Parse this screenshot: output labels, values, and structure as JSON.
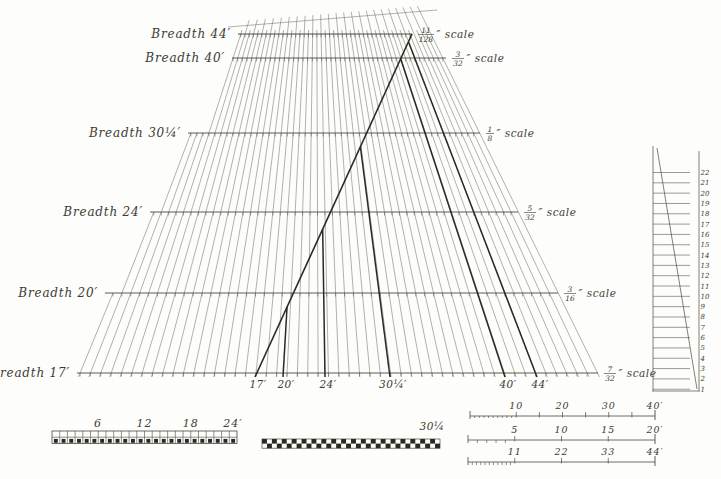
{
  "diagram": {
    "ink_color": "#3c3c33",
    "thin_line_color": "#72726a",
    "medium_line_color": "#4a4a40",
    "bold_line_color": "#2a2a22",
    "breadth_rows": [
      {
        "breadth": "Breadth 44′",
        "num": "11",
        "den": "128",
        "suffix": "″ scale"
      },
      {
        "breadth": "Breadth 40′",
        "num": "3",
        "den": "32",
        "suffix": "″ scale"
      },
      {
        "breadth": "Breadth 30¼′",
        "num": "1",
        "den": "8",
        "suffix": "″ scale"
      },
      {
        "breadth": "Breadth 24′",
        "num": "5",
        "den": "32",
        "suffix": "″ scale"
      },
      {
        "breadth": "Breadth 20′",
        "num": "3",
        "den": "16",
        "suffix": "″ scale"
      },
      {
        "breadth": "Breadth 17′",
        "num": "7",
        "den": "32",
        "suffix": "″ scale"
      }
    ],
    "bottom_axis_labels": [
      "17′",
      "20′",
      "24′",
      "30¼′",
      "40′",
      "44′"
    ],
    "right_ruler_numbers": [
      "22",
      "21",
      "20",
      "19",
      "18",
      "17",
      "16",
      "15",
      "14",
      "13",
      "12",
      "11",
      "10",
      "9",
      "8",
      "7",
      "6",
      "5",
      "4",
      "3",
      "2",
      "1"
    ],
    "left_bar_labels": [
      "6",
      "12",
      "18",
      "24′"
    ],
    "middle_bar_label": "30¼",
    "foot_rulers": [
      {
        "labels": [
          "10",
          "20",
          "30",
          "40′"
        ]
      },
      {
        "labels": [
          "5",
          "10",
          "15",
          "20′"
        ]
      },
      {
        "labels": [
          "11",
          "22",
          "33",
          "44′"
        ]
      }
    ]
  }
}
